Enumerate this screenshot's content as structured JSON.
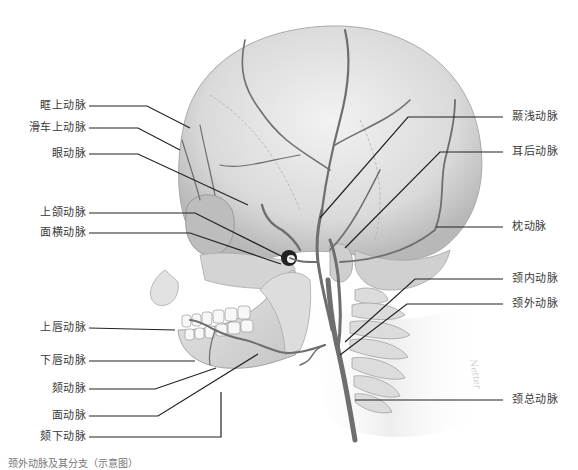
{
  "figure": {
    "watermark": "Netter",
    "caption": "颈外动脉及其分支（示意图）"
  },
  "labels_left": [
    {
      "id": "supraorbital",
      "text": "眶上动脉"
    },
    {
      "id": "supratrochlear",
      "text": "滑车上动脉"
    },
    {
      "id": "ophthalmic",
      "text": "眼动脉"
    },
    {
      "id": "maxillary",
      "text": "上颌动脉"
    },
    {
      "id": "transverse-facial",
      "text": "面横动脉"
    },
    {
      "id": "superior-labial",
      "text": "上唇动脉"
    },
    {
      "id": "inferior-labial",
      "text": "下唇动脉"
    },
    {
      "id": "mental",
      "text": "颏动脉"
    },
    {
      "id": "facial",
      "text": "面动脉"
    },
    {
      "id": "submental",
      "text": "颏下动脉"
    }
  ],
  "labels_right": [
    {
      "id": "superficial-temporal",
      "text": "颞浅动脉"
    },
    {
      "id": "posterior-auricular",
      "text": "耳后动脉"
    },
    {
      "id": "occipital",
      "text": "枕动脉"
    },
    {
      "id": "internal-carotid",
      "text": "颈内动脉"
    },
    {
      "id": "external-carotid",
      "text": "颈外动脉"
    },
    {
      "id": "common-carotid",
      "text": "颈总动脉"
    }
  ],
  "colors": {
    "bone": "#dcdcdc",
    "bone_shadow": "#b5b5b5",
    "artery": "#6e6e6e",
    "leader_line": "#222222",
    "label_text": "#3a3a3a"
  }
}
